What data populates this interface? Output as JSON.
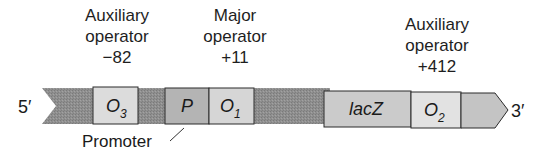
{
  "diagram": {
    "type": "lac operon map",
    "strand_labels": {
      "five_prime": "5′",
      "three_prime": "3′"
    },
    "annotations": [
      {
        "id": "aux-o3",
        "lines": [
          "Auxiliary",
          "operator",
          "−82"
        ]
      },
      {
        "id": "major-o1",
        "lines": [
          "Major",
          "operator",
          "+11"
        ]
      },
      {
        "id": "aux-o2",
        "lines": [
          "Auxiliary",
          "operator",
          "+412"
        ]
      }
    ],
    "elements": [
      {
        "id": "O3",
        "main": "O",
        "sub": "3"
      },
      {
        "id": "P",
        "main": "P",
        "sub": ""
      },
      {
        "id": "O1",
        "main": "O",
        "sub": "1"
      },
      {
        "id": "lacZ",
        "main": "lacZ",
        "sub": ""
      },
      {
        "id": "O2",
        "main": "O",
        "sub": "2"
      }
    ],
    "promoter_label": "Promoter",
    "colors": {
      "dna_band": "#8f8f8f",
      "operator_box": "#dcdcdc",
      "promoter_box": "#b4b4b4",
      "lacz_box": "#cbcbcb",
      "arrow_tail": "#c4c4c4",
      "outline": "#2a2a2a"
    }
  }
}
